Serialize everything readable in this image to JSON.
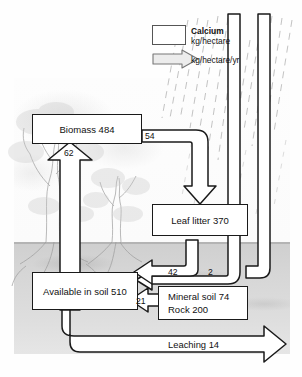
{
  "diagram": {
    "legend": {
      "title": "Calcium",
      "pool_unit": "kg/hectare",
      "flux_unit": "kg/hectare/yr",
      "pool_swatch": "pool-box-swatch",
      "flux_swatch": "flux-arrow-swatch"
    },
    "pools": [
      {
        "name": "biomass",
        "label": "Biomass 484"
      },
      {
        "name": "leaf-litter",
        "label": "Leaf litter 370"
      },
      {
        "name": "available-in-soil",
        "label": "Available in soil 510"
      },
      {
        "name": "mineral-soil-rock",
        "line1": "Mineral soil 74",
        "line2": "Rock 200"
      }
    ],
    "fluxes": [
      {
        "name": "biomass-to-leaf-litter",
        "label": "54"
      },
      {
        "name": "soil-to-biomass-uptake",
        "label": "62"
      },
      {
        "name": "leaf-litter-to-soil",
        "label": "42"
      },
      {
        "name": "precipitation-to-soil",
        "label": "2"
      },
      {
        "name": "mineral-weathering-to-soil",
        "label": "21"
      },
      {
        "name": "leaching-loss",
        "label": "Leaching 14"
      }
    ],
    "colors": {
      "outline": "#1a1a1a",
      "channel_fill": "#ffffff",
      "ground": "#d6d6d6",
      "text": "#111111"
    }
  }
}
